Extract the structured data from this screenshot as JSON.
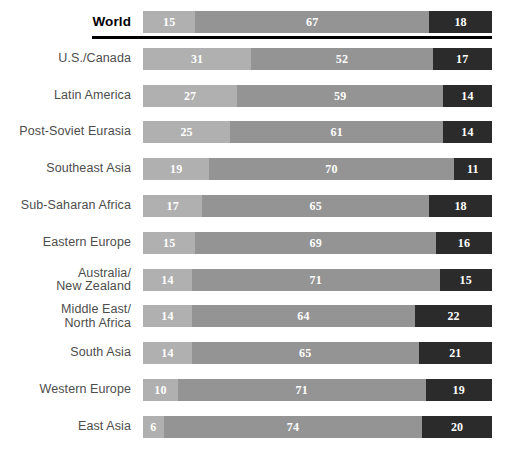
{
  "chart_data": {
    "type": "bar",
    "title": "",
    "subtitle": "",
    "xlabel": "",
    "ylabel": "",
    "orientation": "horizontal",
    "stacked": true,
    "normalized_percent": true,
    "xlim": [
      0,
      100
    ],
    "grid": false,
    "legend_position": "none",
    "series": [
      {
        "name": "segment-1",
        "color": "#b0b0b0",
        "values": [
          15,
          31,
          27,
          25,
          19,
          17,
          15,
          14,
          14,
          14,
          10,
          6
        ]
      },
      {
        "name": "segment-2",
        "color": "#949494",
        "values": [
          67,
          52,
          59,
          61,
          70,
          65,
          69,
          71,
          64,
          65,
          71,
          74
        ]
      },
      {
        "name": "segment-3",
        "color": "#2b2b2b",
        "values": [
          18,
          17,
          14,
          14,
          11,
          18,
          16,
          15,
          22,
          21,
          19,
          20
        ]
      }
    ],
    "categories": [
      "World",
      "U.S./Canada",
      "Latin America",
      "Post-Soviet Eurasia",
      "Southeast Asia",
      "Sub-Saharan Africa",
      "Eastern Europe",
      "Australia/\nNew Zealand",
      "Middle East/\nNorth Africa",
      "South Asia",
      "Western Europe",
      "East Asia"
    ]
  },
  "rows": [
    {
      "label": "World",
      "emphasis": true,
      "segments": [
        {
          "value": 15,
          "label": "15",
          "color": "#b0b0b0"
        },
        {
          "value": 67,
          "label": "67",
          "color": "#949494"
        },
        {
          "value": 18,
          "label": "18",
          "color": "#2b2b2b"
        }
      ]
    },
    {
      "label": "U.S./Canada",
      "emphasis": false,
      "segments": [
        {
          "value": 31,
          "label": "31",
          "color": "#b0b0b0"
        },
        {
          "value": 52,
          "label": "52",
          "color": "#949494"
        },
        {
          "value": 17,
          "label": "17",
          "color": "#2b2b2b"
        }
      ]
    },
    {
      "label": "Latin America",
      "emphasis": false,
      "segments": [
        {
          "value": 27,
          "label": "27",
          "color": "#b0b0b0"
        },
        {
          "value": 59,
          "label": "59",
          "color": "#949494"
        },
        {
          "value": 14,
          "label": "14",
          "color": "#2b2b2b"
        }
      ]
    },
    {
      "label": "Post-Soviet Eurasia",
      "emphasis": false,
      "segments": [
        {
          "value": 25,
          "label": "25",
          "color": "#b0b0b0"
        },
        {
          "value": 61,
          "label": "61",
          "color": "#949494"
        },
        {
          "value": 14,
          "label": "14",
          "color": "#2b2b2b"
        }
      ]
    },
    {
      "label": "Southeast Asia",
      "emphasis": false,
      "segments": [
        {
          "value": 19,
          "label": "19",
          "color": "#b0b0b0"
        },
        {
          "value": 70,
          "label": "70",
          "color": "#949494"
        },
        {
          "value": 11,
          "label": "11",
          "color": "#2b2b2b"
        }
      ]
    },
    {
      "label": "Sub-Saharan Africa",
      "emphasis": false,
      "segments": [
        {
          "value": 17,
          "label": "17",
          "color": "#b0b0b0"
        },
        {
          "value": 65,
          "label": "65",
          "color": "#949494"
        },
        {
          "value": 18,
          "label": "18",
          "color": "#2b2b2b"
        }
      ]
    },
    {
      "label": "Eastern Europe",
      "emphasis": false,
      "segments": [
        {
          "value": 15,
          "label": "15",
          "color": "#b0b0b0"
        },
        {
          "value": 69,
          "label": "69",
          "color": "#949494"
        },
        {
          "value": 16,
          "label": "16",
          "color": "#2b2b2b"
        }
      ]
    },
    {
      "label": "Australia/\nNew Zealand",
      "emphasis": false,
      "segments": [
        {
          "value": 14,
          "label": "14",
          "color": "#b0b0b0"
        },
        {
          "value": 71,
          "label": "71",
          "color": "#949494"
        },
        {
          "value": 15,
          "label": "15",
          "color": "#2b2b2b"
        }
      ]
    },
    {
      "label": "Middle East/\nNorth Africa",
      "emphasis": false,
      "segments": [
        {
          "value": 14,
          "label": "14",
          "color": "#b0b0b0"
        },
        {
          "value": 64,
          "label": "64",
          "color": "#949494"
        },
        {
          "value": 22,
          "label": "22",
          "color": "#2b2b2b"
        }
      ]
    },
    {
      "label": "South Asia",
      "emphasis": false,
      "segments": [
        {
          "value": 14,
          "label": "14",
          "color": "#b0b0b0"
        },
        {
          "value": 65,
          "label": "65",
          "color": "#949494"
        },
        {
          "value": 21,
          "label": "21",
          "color": "#2b2b2b"
        }
      ]
    },
    {
      "label": "Western Europe",
      "emphasis": false,
      "segments": [
        {
          "value": 10,
          "label": "10",
          "color": "#b0b0b0"
        },
        {
          "value": 71,
          "label": "71",
          "color": "#949494"
        },
        {
          "value": 19,
          "label": "19",
          "color": "#2b2b2b"
        }
      ]
    },
    {
      "label": "East Asia",
      "emphasis": false,
      "segments": [
        {
          "value": 6,
          "label": "6",
          "color": "#b0b0b0"
        },
        {
          "value": 74,
          "label": "74",
          "color": "#949494"
        },
        {
          "value": 20,
          "label": "20",
          "color": "#2b2b2b"
        }
      ]
    }
  ],
  "layout": {
    "bar_left_px": 143,
    "bar_width_px": 349,
    "bar_height_px": 22,
    "row_pitch_px": 36.8,
    "first_row_top_px": 11,
    "world_rule_left_px": 92,
    "world_rule_width_px": 400,
    "world_rule_top_px": 36
  },
  "colors": {
    "background": "#ffffff",
    "label_text": "#4d4d4d",
    "emphasis_text": "#000000",
    "segment_light": "#b0b0b0",
    "segment_mid": "#949494",
    "segment_dark": "#2b2b2b",
    "value_text": "#ffffff",
    "rule": "#000000"
  }
}
